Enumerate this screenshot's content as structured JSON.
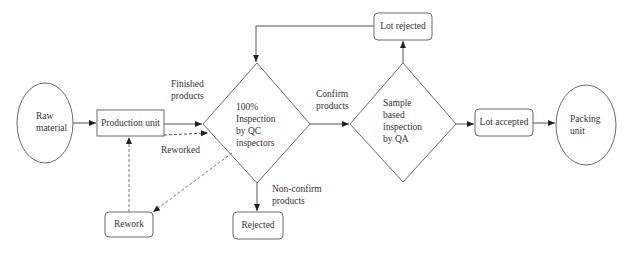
{
  "diagram": {
    "type": "flowchart",
    "colors": {
      "stroke": "#6a6a6a",
      "text": "#333333",
      "background": "#ffffff"
    },
    "nodes": {
      "raw_material": {
        "shape": "ellipse",
        "line1": "Raw",
        "line2": "material"
      },
      "production_unit": {
        "shape": "rectangle",
        "label": "Production unit"
      },
      "qc_inspection": {
        "shape": "diamond",
        "line1": "100%",
        "line2": "Inspection",
        "line3": "by QC",
        "line4": "inspectors"
      },
      "qa_inspection": {
        "shape": "diamond",
        "line1": "Sample",
        "line2": "based",
        "line3": "inspection",
        "line4": "by QA"
      },
      "lot_rejected": {
        "shape": "rounded-rectangle",
        "label": "Lot rejected"
      },
      "lot_accepted": {
        "shape": "rounded-rectangle",
        "label": "Lot accepted"
      },
      "packing_unit": {
        "shape": "ellipse",
        "line1": "Packing",
        "line2": "unit"
      },
      "rework": {
        "shape": "rounded-rectangle",
        "label": "Rework"
      },
      "rejected": {
        "shape": "rounded-rectangle",
        "label": "Rejected"
      }
    },
    "edge_labels": {
      "finished_products": {
        "line1": "Finished",
        "line2": "products"
      },
      "confirm_products": {
        "line1": "Confirm",
        "line2": "products"
      },
      "non_confirm_products": {
        "line1": "Non-confirm",
        "line2": "products"
      },
      "reworked": "Reworked"
    },
    "edges": [
      {
        "from": "Raw material",
        "to": "Production unit",
        "style": "solid"
      },
      {
        "from": "Production unit",
        "to": "100% Inspection by QC inspectors",
        "label": "Finished products",
        "style": "solid"
      },
      {
        "from": "100% Inspection by QC inspectors",
        "to": "Sample based inspection by QA",
        "label": "Confirm products",
        "style": "solid"
      },
      {
        "from": "100% Inspection by QC inspectors",
        "to": "Rejected",
        "label": "Non-confirm products",
        "style": "solid"
      },
      {
        "from": "100% Inspection by QC inspectors",
        "to": "Rework",
        "style": "dashed"
      },
      {
        "from": "Rework",
        "to": "Production unit",
        "style": "dashed"
      },
      {
        "from": "Production unit",
        "to": "100% Inspection by QC inspectors",
        "label": "Reworked",
        "style": "dashed"
      },
      {
        "from": "Sample based inspection by QA",
        "to": "Lot rejected",
        "style": "solid"
      },
      {
        "from": "Lot rejected",
        "to": "100% Inspection by QC inspectors",
        "style": "solid"
      },
      {
        "from": "Sample based inspection by QA",
        "to": "Lot accepted",
        "style": "solid"
      },
      {
        "from": "Lot accepted",
        "to": "Packing unit",
        "style": "solid"
      }
    ]
  }
}
